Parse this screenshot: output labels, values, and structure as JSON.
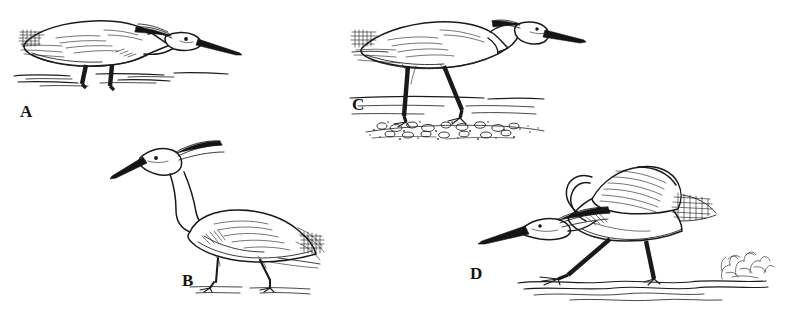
{
  "plate": {
    "title": "Egret foraging postures",
    "background_color": "#ffffff",
    "ink_color": "#1a1a1a",
    "medium": "pen-and-ink line drawing",
    "panel_count": 4
  },
  "panels": [
    {
      "id": "A",
      "label": "A",
      "subject": "egret crouched low, neck drawn back in strike-ready posture, bill angled forward over shallow water",
      "habitat": "open shallow water with broken ripple lines",
      "leg_rendering": "short thick black legs partly submerged",
      "plumage_detail": "cross-hatched scapular and wing-tip feather texture"
    },
    {
      "id": "B",
      "label": "B",
      "subject": "egret standing upright and alert, neck raised in an S-curve, head plumes trailing",
      "habitat": "flat damp ground with faint ground line",
      "leg_rendering": "long slender legs with spread toes",
      "plumage_detail": "fine hatching along the wing and long filamentous back plumes"
    },
    {
      "id": "C",
      "label": "C",
      "subject": "egret striding forward with neck folded and bill held horizontal",
      "habitat": "pebbled shoreline with stippled gravel bank and horizontal water lines behind",
      "leg_rendering": "long thick black legs, one lifted mid-stride",
      "plumage_detail": "streaked wing coverts and trailing tail plumes"
    },
    {
      "id": "D",
      "label": "D",
      "subject": "egret lunging in a dramatic strike, wings raised and body pitched forward, bill thrust low toward the water",
      "habitat": "rippled shallow water with a sketchy shrub tuft at the right",
      "leg_rendering": "thick black legs splayed in a wide stride",
      "plumage_detail": "parallel flight-feather lines on the raised wing and dense cross-hatched tail"
    }
  ],
  "labels": {
    "a": "A",
    "b": "B",
    "c": "C",
    "d": "D"
  }
}
